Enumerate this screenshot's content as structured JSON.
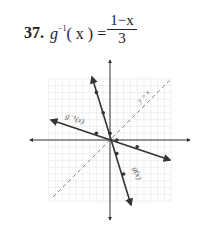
{
  "problem": {
    "number": "37.",
    "lhs_func": "g",
    "lhs_sup": "−1",
    "lhs_arg": "( x ) =",
    "numerator": "1−x",
    "denominator": "3"
  },
  "chart_data": {
    "type": "line",
    "xlabel": "",
    "ylabel": "",
    "xlim": [
      -10,
      10
    ],
    "ylim": [
      -10,
      10
    ],
    "grid": true,
    "series": [
      {
        "name": "g(x)",
        "equation": "y = 1 - 3x",
        "style": "solid",
        "points": [
          [
            -2,
            7
          ],
          [
            -1,
            4
          ],
          [
            0,
            1
          ],
          [
            1,
            -2
          ],
          [
            2,
            -5
          ]
        ]
      },
      {
        "name": "g^-1(x)",
        "equation": "y = (1 - x)/3",
        "style": "solid",
        "points": [
          [
            -2,
            1
          ],
          [
            1,
            0
          ],
          [
            4,
            -1
          ]
        ]
      },
      {
        "name": "y = x",
        "equation": "y = x",
        "style": "dashed",
        "points": [
          [
            -8,
            -8
          ],
          [
            8,
            8
          ]
        ]
      }
    ],
    "annotations": [
      "g^-1(x)",
      "y = x",
      "g(x)"
    ]
  },
  "labels": {
    "ginv": "g⁻¹(x)",
    "yx": "y = x",
    "g": "g(x)"
  },
  "colors": {
    "line": "#333333",
    "grid": "#e2e2e2",
    "dash": "#888888"
  }
}
